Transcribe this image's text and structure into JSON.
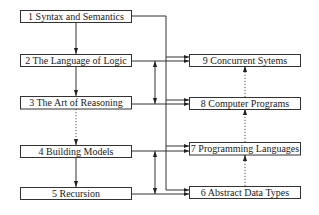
{
  "diagram": {
    "nodes": [
      {
        "id": "n1",
        "number": "1",
        "label": "1  Syntax and Semantics"
      },
      {
        "id": "n2",
        "number": "2",
        "label": "2  The Language of Logic"
      },
      {
        "id": "n3",
        "number": "3",
        "label": "3  The Art of Reasoning"
      },
      {
        "id": "n4",
        "number": "4",
        "label": "4  Building Models"
      },
      {
        "id": "n5",
        "number": "5",
        "label": "5  Recursion"
      },
      {
        "id": "n6",
        "number": "6",
        "label": "6  Abstract Data Types"
      },
      {
        "id": "n7",
        "number": "7",
        "label": "7  Programming Languages"
      },
      {
        "id": "n8",
        "number": "8",
        "label": "8  Computer Programs"
      },
      {
        "id": "n9",
        "number": "9",
        "label": "9  Concurrent Sytems"
      }
    ],
    "edges": [
      {
        "from": "1",
        "to": "2",
        "style": "solid"
      },
      {
        "from": "2",
        "to": "3",
        "style": "solid"
      },
      {
        "from": "3",
        "to": "4",
        "style": "dotted"
      },
      {
        "from": "4",
        "to": "5",
        "style": "solid"
      },
      {
        "from": "2",
        "to": "3",
        "style": "solid",
        "bidirectional": true
      },
      {
        "from": "4",
        "to": "5",
        "style": "solid",
        "bidirectional": true
      },
      {
        "from": "1",
        "to": "6",
        "style": "solid"
      },
      {
        "from": "1",
        "to": "7",
        "style": "solid"
      },
      {
        "from": "1",
        "to": "8",
        "style": "solid"
      },
      {
        "from": "1",
        "to": "9",
        "style": "solid"
      },
      {
        "from": "2",
        "to": "9",
        "style": "solid"
      },
      {
        "from": "3",
        "to": "8",
        "style": "solid"
      },
      {
        "from": "4",
        "to": "7",
        "style": "solid"
      },
      {
        "from": "5",
        "to": "6",
        "style": "solid"
      },
      {
        "from": "6",
        "to": "7",
        "style": "dotted"
      },
      {
        "from": "7",
        "to": "8",
        "style": "dotted"
      },
      {
        "from": "8",
        "to": "9",
        "style": "dotted"
      }
    ]
  }
}
